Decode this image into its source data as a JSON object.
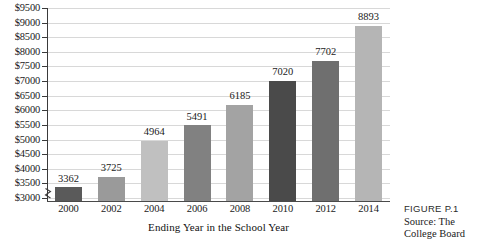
{
  "figure": {
    "label": "FIGURE P.1",
    "source": "Source: The College Board"
  },
  "axis": {
    "x_title": "Ending Year in the School Year",
    "y_tick_labels": [
      "$3000",
      "$3500",
      "$4000",
      "$4500",
      "$5000",
      "$5500",
      "$6000",
      "$6500",
      "$7000",
      "$7500",
      "$8000",
      "$8500",
      "$9000",
      "$9500"
    ]
  },
  "colors": {
    "bar_dark": "#5a5a5a",
    "bar_darkest": "#3f3f3f",
    "bar_medium": "#8e8e8e",
    "bar_light": "#b8b8b8",
    "gridline": "#d8d8d8",
    "axis": "#3a3a3a",
    "text": "#1a1a1a"
  },
  "chart_data": {
    "type": "bar",
    "title": "",
    "xlabel": "Ending Year in the School Year",
    "ylabel": "",
    "categories": [
      "2000",
      "2002",
      "2004",
      "2006",
      "2008",
      "2010",
      "2012",
      "2014"
    ],
    "values": [
      3362,
      3725,
      4964,
      5491,
      6185,
      7020,
      7702,
      8893
    ],
    "value_labels": [
      "3362",
      "3725",
      "4964",
      "5491",
      "6185",
      "7020",
      "7702",
      "8893"
    ],
    "bar_colors": [
      "#5a5a5a",
      "#9a9a9a",
      "#c0c0c0",
      "#818181",
      "#a3a3a3",
      "#4a4a4a",
      "#6f6f6f",
      "#b5b5b5"
    ],
    "ylim": [
      3000,
      9500
    ],
    "ytick_step": 500,
    "ytick_prefix": "$",
    "grid": true,
    "legend": false,
    "axis_break": true
  }
}
